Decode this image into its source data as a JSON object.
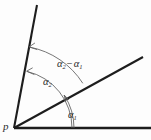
{
  "figure": {
    "kind": "geometry-angle-diagram",
    "background_color": "#fdfdfd",
    "line_color": "#1d1d1d",
    "arc_color": "#5d5d5d",
    "vertex": {
      "label": "p",
      "name": "point-p",
      "x": 14,
      "y": 128
    },
    "rays": [
      {
        "name": "baseline-ray",
        "label": "",
        "from_x": 14,
        "from_y": 128,
        "to_x": 151,
        "to_y": 128,
        "angle_deg": 0
      },
      {
        "name": "ray-alpha1",
        "label": "",
        "from_x": 14,
        "from_y": 128,
        "to_x": 143,
        "to_y": 57,
        "angle_deg": 33
      },
      {
        "name": "ray-alpha2",
        "label": "",
        "from_x": 14,
        "from_y": 128,
        "to_x": 37,
        "to_y": 5,
        "angle_deg": 79
      }
    ],
    "angles": [
      {
        "name": "angle-alpha1",
        "symbol": "α",
        "subscript": "1",
        "from_deg": 0,
        "to_deg": 33,
        "arc_radius": 60,
        "label_x": 68,
        "label_y": 110
      },
      {
        "name": "angle-alpha2",
        "symbol": "α",
        "subscript": "2",
        "from_deg": 0,
        "to_deg": 79,
        "arc_radius": 58,
        "label_x": 43,
        "label_y": 77
      },
      {
        "name": "angle-alpha-difference",
        "symbol_left": "α",
        "subscript_left": "2",
        "operator": "−",
        "symbol_right": "α",
        "subscript_right": "1",
        "from_deg": 33,
        "to_deg": 79,
        "arc_radius": 82,
        "label_x": 57,
        "label_y": 59
      }
    ],
    "labels": {
      "vertex": "p",
      "alpha1_symbol": "α",
      "alpha1_sub": "1",
      "alpha2_symbol": "α",
      "alpha2_sub": "2",
      "diff_left_symbol": "α",
      "diff_left_sub": "2",
      "diff_operator": "−",
      "diff_right_symbol": "α",
      "diff_right_sub": "1"
    }
  }
}
